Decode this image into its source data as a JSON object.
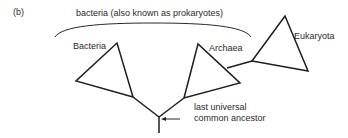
{
  "figure": {
    "panel_label": "(b)",
    "group_bracket_label": "bacteria (also known as prokaryotes)",
    "colors": {
      "line": "#1e1e1e",
      "text": "#2a2a2a",
      "background": "#ffffff"
    },
    "clades": [
      {
        "label": "Bacteria"
      },
      {
        "label": "Archaea"
      },
      {
        "label": "Eukaryota"
      }
    ],
    "root_label_line1": "last universal",
    "root_label_line2": "common ancestor"
  }
}
